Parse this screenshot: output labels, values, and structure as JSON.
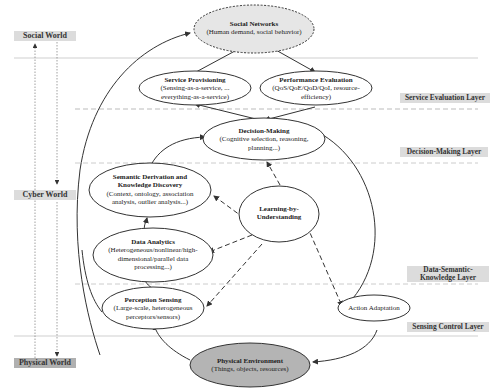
{
  "worlds": [
    {
      "id": "social",
      "label": "Social World"
    },
    {
      "id": "cyber",
      "label": "Cyber World"
    },
    {
      "id": "physical",
      "label": "Physical World"
    }
  ],
  "layers": [
    {
      "id": "service-evaluation",
      "label": "Service Evaluation Layer"
    },
    {
      "id": "decision-making",
      "label": "Decision-Making Layer"
    },
    {
      "id": "data-semantic-knowledge",
      "label_line1": "Data-Semantic-",
      "label_line2": "Knowledge Layer"
    },
    {
      "id": "sensing-control",
      "label": "Sensing Control Layer"
    }
  ],
  "nodes": {
    "social_networks": {
      "title": "Social Networks",
      "subtitle": "(Human demand, social behavior)"
    },
    "service_provisioning": {
      "title": "Service Provisioning",
      "sub1": "(Sensing-as-a-service, ...",
      "sub2": "everything-as-a-service)"
    },
    "performance_evaluation": {
      "title": "Performance Evaluation",
      "sub1": "(QoS/QoE/QoD/QoI, resource-",
      "sub2": "efficiency)"
    },
    "decision_making": {
      "title": "Decision-Making",
      "sub1": "(Cognitive selection, reasoning,",
      "sub2": "planning...)"
    },
    "semantic_derivation": {
      "title1": "Semantic Derivation and",
      "title2": "Knowledge Discovery",
      "sub1": "(Context, ontology, association",
      "sub2": "analysis, outlier analysis...)"
    },
    "learning": {
      "title1": "Learning-by-",
      "title2": "Understanding"
    },
    "data_analytics": {
      "title": "Data Analytics",
      "sub1": "(Heterogeneous/nonlinear/high-",
      "sub2": "dimensional/parallel data",
      "sub3": "processing...)"
    },
    "perception_sensing": {
      "title": "Perception Sensing",
      "sub1": "(Large-scale, heterogeneous",
      "sub2": "perceptors/sensors)"
    },
    "action_adaptation": {
      "title": "Action Adaptation"
    },
    "physical_environment": {
      "title": "Physical Environment",
      "subtitle": "(Things, objects, resources)"
    }
  },
  "colors": {
    "label_bg": "#dcdcdc",
    "social_fill": "#e6e6e6",
    "physical_fill": "#b4b4b4",
    "line": "#333333",
    "divider": "#c8c8c8"
  }
}
